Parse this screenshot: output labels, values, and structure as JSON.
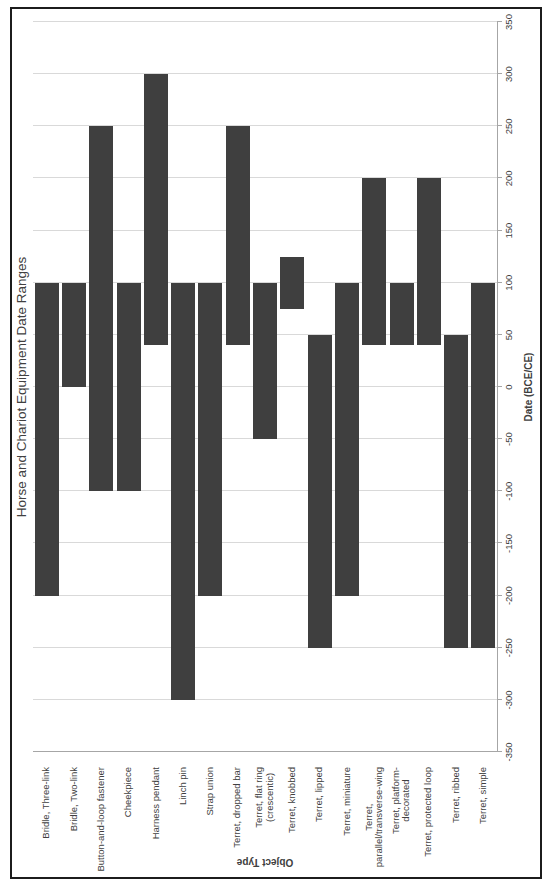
{
  "chart_data": {
    "type": "bar",
    "orientation": "horizontal-range",
    "rotated_on_page": "90deg counterclockwise",
    "title": "Horse and Chariot Equipment Date Ranges",
    "xlabel": "Date (BCE/CE)",
    "ylabel": "Object Type",
    "xlim": [
      -350,
      350
    ],
    "xticks": [
      -350,
      -300,
      -250,
      -200,
      -150,
      -100,
      -50,
      0,
      50,
      100,
      150,
      200,
      250,
      300,
      350
    ],
    "grid": true,
    "legend": "none",
    "series": [
      {
        "category": "Bridle, Three-link",
        "start": -200,
        "end": 100
      },
      {
        "category": "Bridle, Two-link",
        "start": 0,
        "end": 100
      },
      {
        "category": "Button-and-loop fastener",
        "start": -100,
        "end": 250
      },
      {
        "category": "Cheekpiece",
        "start": -100,
        "end": 100
      },
      {
        "category": "Harness pendant",
        "start": 40,
        "end": 300
      },
      {
        "category": "Linch pin",
        "start": -300,
        "end": 100
      },
      {
        "category": "Strap union",
        "start": -200,
        "end": 100
      },
      {
        "category": "Terret, dropped bar",
        "start": 40,
        "end": 250
      },
      {
        "category": "Terret, flat ring (crescentic)",
        "display": "Terret, flat ring\n(crescentic)",
        "start": -50,
        "end": 100
      },
      {
        "category": "Terret, knobbed",
        "start": 75,
        "end": 125
      },
      {
        "category": "Terret, lipped",
        "start": -250,
        "end": 50
      },
      {
        "category": "Terret, miniature",
        "start": -200,
        "end": 100
      },
      {
        "category": "Terret, parallel/transverse-wing",
        "display": "Terret,\nparallel/transverse-wing",
        "start": 40,
        "end": 200
      },
      {
        "category": "Terret, platform-decorated",
        "display": "Terret, platform-\ndecorated",
        "start": 40,
        "end": 100
      },
      {
        "category": "Terret, protected loop",
        "start": 40,
        "end": 200
      },
      {
        "category": "Terret, ribbed",
        "start": -250,
        "end": 50
      },
      {
        "category": "Terret, simple",
        "start": -250,
        "end": 100
      }
    ]
  },
  "colors": {
    "bar": "#3f3f3f",
    "gridline": "#d9d9d9",
    "axis_line": "#a6a6a6",
    "border": "#1c1c1c",
    "text": "#404040",
    "background": "#ffffff"
  }
}
